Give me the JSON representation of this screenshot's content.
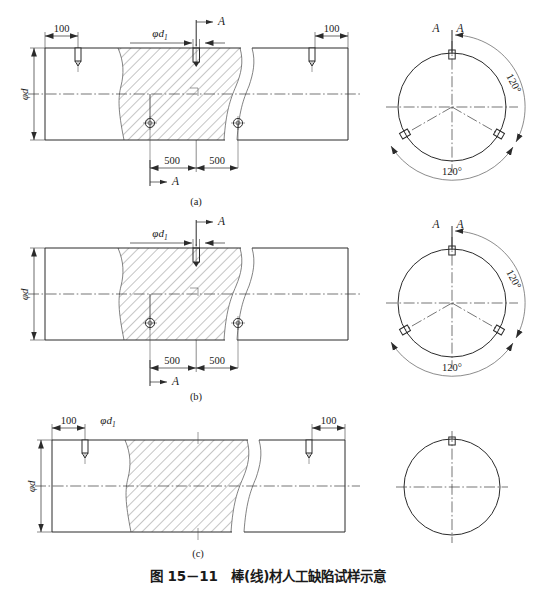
{
  "figure": {
    "caption": "图 15－11　棒(线)材人工缺陷试样示意",
    "caption_number": "图 15－11",
    "caption_title": "棒(线)材人工缺陷试样示意"
  },
  "panels": [
    {
      "id": "a",
      "sublabel": "(a)",
      "end_dim_left": "100",
      "end_dim_right": "100",
      "notch_dia_label": "φd",
      "notch_dia_sub": "1",
      "bar_dia_label": "φd",
      "spacing_left": "500",
      "spacing_right": "500",
      "section_mark_top": "A",
      "section_mark_bottom": "A",
      "section_view": {
        "mark_left": "A",
        "mark_right": "A",
        "angle_right": "120°",
        "angle_bottom": "120°",
        "notch_count": 3,
        "hatched": true
      }
    },
    {
      "id": "b",
      "sublabel": "(b)",
      "end_dim_left": "",
      "end_dim_right": "",
      "notch_dia_label": "φd",
      "notch_dia_sub": "1",
      "bar_dia_label": "φd",
      "spacing_left": "500",
      "spacing_right": "500",
      "section_mark_top": "A",
      "section_mark_bottom": "A",
      "section_view": {
        "mark_left": "A",
        "mark_right": "A",
        "angle_right": "120°",
        "angle_bottom": "120°",
        "notch_count": 3,
        "hatched": true
      }
    },
    {
      "id": "c",
      "sublabel": "(c)",
      "end_dim_left": "100",
      "end_dim_right": "100",
      "notch_dia_label": "φd",
      "notch_dia_sub": "1",
      "bar_dia_label": "φd",
      "section_view": {
        "notch_count": 1,
        "hatched": false
      }
    }
  ],
  "colors": {
    "line": "#2b2b2b",
    "thin_line": "#3a3a3a",
    "break_line": "#5a5a5a",
    "background": "#ffffff"
  }
}
